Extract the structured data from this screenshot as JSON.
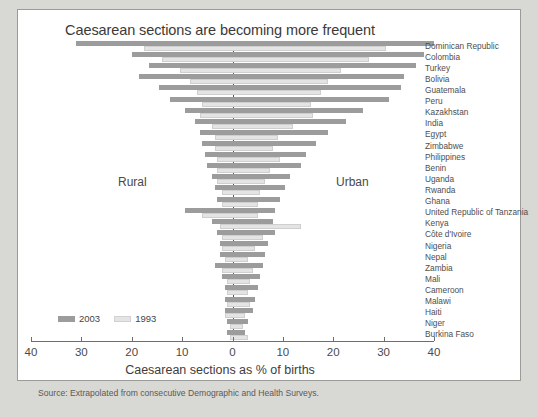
{
  "figure": {
    "title": "Caesarean sections are becoming more frequent",
    "xlabel": "Caesarean sections as % of births",
    "source": "Source: Extrapolated from consecutive Demographic and Health Surveys.",
    "rural_side_label": "Rural",
    "urban_side_label": "Urban",
    "legend": [
      {
        "label": "2003",
        "color": "#9c9c9c"
      },
      {
        "label": "1993",
        "color": "#e4e4e4"
      }
    ]
  },
  "chart_data": {
    "type": "bar",
    "subtype": "diverging-horizontal-bar",
    "title": "Caesarean sections are becoming more frequent",
    "xlabel": "Caesarean sections as % of births",
    "ylabel": "",
    "left_side": "Rural",
    "right_side": "Urban",
    "xlim": [
      -40,
      40
    ],
    "xticks": [
      40,
      30,
      20,
      10,
      0,
      10,
      20,
      30,
      40
    ],
    "grid": false,
    "legend_position": "bottom-left",
    "legend": [
      "2003",
      "1993"
    ],
    "categories": [
      "Dominican Republic",
      "Colombia",
      "Turkey",
      "Bolivia",
      "Guatemala",
      "Peru",
      "Kazakhstan",
      "India",
      "Egypt",
      "Zimbabwe",
      "Philippines",
      "Benin",
      "Uganda",
      "Rwanda",
      "Ghana",
      "United Republic of Tanzania",
      "Kenya",
      "Côte d'Ivoire",
      "Nigeria",
      "Nepal",
      "Zambia",
      "Mali",
      "Cameroon",
      "Malawi",
      "Haiti",
      "Niger",
      "Burkina Faso"
    ],
    "series": [
      {
        "name": "2003",
        "color": "#9c9c9c",
        "rural": [
          31.0,
          20.0,
          16.5,
          18.5,
          14.5,
          12.5,
          9.5,
          7.5,
          6.5,
          6.0,
          5.5,
          5.0,
          4.0,
          3.5,
          3.0,
          9.5,
          4.0,
          3.0,
          2.5,
          2.5,
          3.5,
          2.0,
          1.5,
          1.5,
          1.5,
          1.0,
          1.0
        ],
        "urban": [
          40.0,
          38.0,
          36.5,
          34.0,
          33.5,
          31.0,
          26.0,
          22.5,
          19.0,
          16.5,
          14.5,
          13.5,
          11.5,
          10.5,
          9.5,
          8.5,
          8.0,
          8.5,
          7.0,
          6.5,
          6.0,
          5.5,
          5.0,
          4.5,
          4.0,
          3.0,
          2.5
        ]
      },
      {
        "name": "1993",
        "color": "#e4e4e4",
        "rural": [
          17.5,
          14.0,
          10.5,
          8.5,
          7.0,
          6.0,
          6.5,
          4.0,
          3.5,
          3.5,
          3.0,
          3.0,
          3.0,
          2.0,
          2.0,
          6.0,
          2.5,
          2.0,
          2.0,
          1.5,
          2.0,
          1.0,
          1.0,
          1.0,
          1.5,
          0.5,
          0.5
        ],
        "urban": [
          30.5,
          27.0,
          21.5,
          19.0,
          17.5,
          15.5,
          16.0,
          12.0,
          9.0,
          8.0,
          9.5,
          7.5,
          6.5,
          5.5,
          5.0,
          5.0,
          13.5,
          6.0,
          4.5,
          3.0,
          4.0,
          3.5,
          3.0,
          3.5,
          2.5,
          2.0,
          3.0
        ]
      }
    ]
  }
}
